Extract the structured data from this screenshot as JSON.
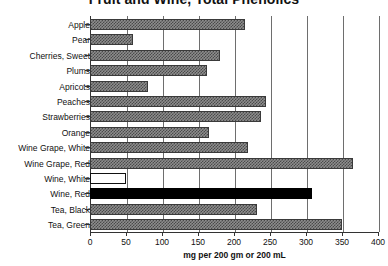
{
  "chart_data": {
    "type": "bar",
    "orientation": "horizontal",
    "title": "Fruit and Wine, Total Phenolics",
    "xlabel": "mg per 200 gm or 200 mL",
    "ylabel": "",
    "xlim": [
      0,
      400
    ],
    "xticks": [
      "0",
      "50",
      "100",
      "150",
      "200",
      "250",
      "300",
      "350",
      "400"
    ],
    "xtick_values": [
      0,
      50,
      100,
      150,
      200,
      250,
      300,
      350,
      400
    ],
    "grid": "vertical",
    "legend": "none",
    "categories": [
      "Apple",
      "Pear",
      "Cherries, Sweet",
      "Plums",
      "Apricots",
      "Peaches",
      "Strawberries",
      "Orange",
      "Wine Grape, White",
      "Wine Grape, Red",
      "Wine, White",
      "Wine, Red",
      "Tea, Black",
      "Tea, Green"
    ],
    "values": [
      215,
      60,
      180,
      162,
      80,
      245,
      238,
      165,
      220,
      365,
      50,
      308,
      232,
      350
    ],
    "bar_styles": [
      "hatch",
      "hatch",
      "hatch",
      "hatch",
      "hatch",
      "hatch",
      "hatch",
      "hatch",
      "hatch",
      "hatch",
      "empty",
      "solid",
      "hatch",
      "hatch"
    ],
    "colors": {
      "hatch_fill": "#8d8d8d",
      "hatch_pattern": "#4a4a4a",
      "solid_fill": "#000000",
      "empty_fill": "#ffffff",
      "axis": "#333333",
      "grid": "#6e6e6e",
      "background": "#ffffff",
      "text": "#111111"
    }
  }
}
